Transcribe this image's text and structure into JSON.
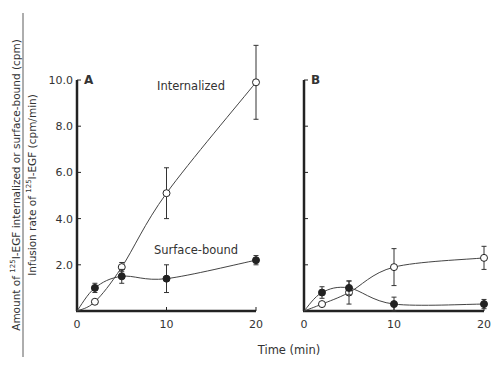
{
  "chart_data": [
    {
      "type": "line",
      "panel": "A",
      "xlabel": "Time (min)",
      "ylabel_numerator": "Amount of 125I-EGF internalized or surface-bound (cpm)",
      "ylabel_denominator": "Infusion rate of 125I-EGF (cpm/min)",
      "xticks": [
        "0",
        "10",
        "20"
      ],
      "yticks": [
        "2.0",
        "4.0",
        "6.0",
        "8.0",
        "10.0"
      ],
      "xlim": [
        0,
        20
      ],
      "ylim": [
        0,
        10
      ],
      "series": [
        {
          "name": "Internalized",
          "marker": "open-circle",
          "x": [
            0,
            2,
            5,
            10,
            20
          ],
          "values": [
            0,
            0.4,
            1.9,
            5.1,
            9.9
          ],
          "err": [
            0,
            0,
            0.2,
            1.1,
            1.6
          ]
        },
        {
          "name": "Surface-bound",
          "marker": "filled-circle",
          "x": [
            0,
            2,
            5,
            10,
            20
          ],
          "values": [
            0,
            1.0,
            1.5,
            1.4,
            2.2
          ],
          "err": [
            0,
            0.2,
            0.3,
            0.6,
            0.2
          ]
        }
      ],
      "annotations": [
        "Internalized",
        "Surface-bound"
      ]
    },
    {
      "type": "line",
      "panel": "B",
      "xlabel": "Time (min)",
      "xticks": [
        "0",
        "10",
        "20"
      ],
      "xlim": [
        0,
        20
      ],
      "ylim": [
        0,
        10
      ],
      "series": [
        {
          "name": "Internalized",
          "marker": "open-circle",
          "x": [
            0,
            2,
            5,
            10,
            20
          ],
          "values": [
            0,
            0.3,
            0.8,
            1.9,
            2.3
          ],
          "err": [
            0,
            0,
            0.5,
            0.8,
            0.5
          ]
        },
        {
          "name": "Surface-bound",
          "marker": "filled-circle",
          "x": [
            0,
            2,
            5,
            10,
            20
          ],
          "values": [
            0,
            0.8,
            1.0,
            0.3,
            0.3
          ],
          "err": [
            0,
            0.25,
            0.3,
            0.3,
            0.2
          ]
        }
      ]
    }
  ],
  "labels": {
    "panel_a": "A",
    "panel_b": "B",
    "internalized": "Internalized",
    "surface_bound": "Surface-bound",
    "xlabel": "Time (min)",
    "ylabel_num": "Amount of 125I-EGF internalized or surface-bound (cpm)",
    "ylabel_den": "Infusion rate of 125I-EGF (cpm/min)",
    "y_ticks": [
      "2.0",
      "4.0",
      "6.0",
      "8.0",
      "10.0"
    ],
    "x_ticks": [
      "0",
      "10",
      "20"
    ]
  }
}
